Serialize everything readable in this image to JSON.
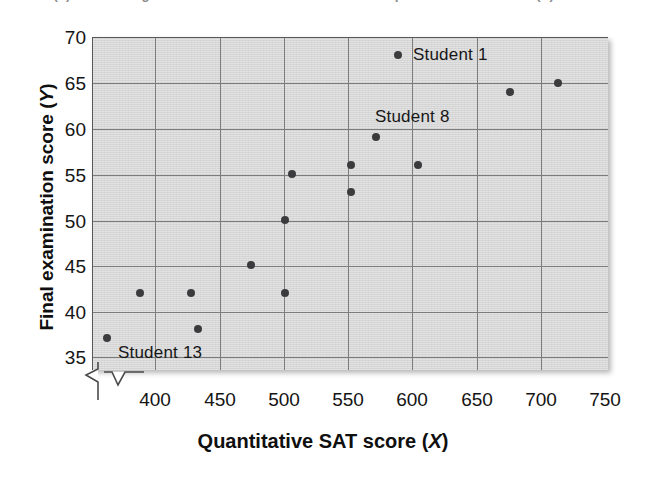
{
  "caption": {
    "text": "FIGURE (b)   Scatter diagram of final examination score versus quantitative SAT score (X)"
  },
  "chart_data": {
    "type": "scatter",
    "title": "",
    "xlabel": "Quantitative SAT score (X)",
    "xlabel_prefix": "Quantitative SAT score (",
    "xlabel_var": "X",
    "xlabel_suffix": ")",
    "ylabel": "Final examination score (Y)",
    "ylabel_prefix": "Final examination score (",
    "ylabel_var": "Y",
    "ylabel_suffix": ")",
    "xlim": [
      370,
      750
    ],
    "ylim": [
      33.5,
      70
    ],
    "xticks": [
      400,
      450,
      500,
      550,
      600,
      650,
      700,
      750
    ],
    "yticks": [
      35,
      40,
      45,
      50,
      55,
      60,
      65,
      70
    ],
    "grid": true,
    "axis_break_x": true,
    "axis_break_y": true,
    "legend": "none",
    "plot_background": "#d6d6d6",
    "point_color": "#3b3b3d",
    "grid_color": "#7c7c7e",
    "points": [
      {
        "x": 381,
        "y": 37,
        "label": ""
      },
      {
        "x": 405,
        "y": 42,
        "label": ""
      },
      {
        "x": 443,
        "y": 42,
        "label": ""
      },
      {
        "x": 448,
        "y": 38,
        "label": ""
      },
      {
        "x": 487,
        "y": 45,
        "label": ""
      },
      {
        "x": 512,
        "y": 42,
        "label": ""
      },
      {
        "x": 512,
        "y": 50,
        "label": ""
      },
      {
        "x": 517,
        "y": 55,
        "label": ""
      },
      {
        "x": 561,
        "y": 53,
        "label": ""
      },
      {
        "x": 561,
        "y": 56,
        "label": ""
      },
      {
        "x": 579,
        "y": 59,
        "label": "Student 8"
      },
      {
        "x": 595,
        "y": 68,
        "label": "Student 1"
      },
      {
        "x": 610,
        "y": 56,
        "label": ""
      },
      {
        "x": 678,
        "y": 64,
        "label": ""
      },
      {
        "x": 713,
        "y": 65,
        "label": ""
      }
    ],
    "annotations": [
      {
        "text": "Student 1",
        "x": 600,
        "y": 68
      },
      {
        "text": "Student 8",
        "x": 560,
        "y": 61
      },
      {
        "text": "Student 13",
        "x": 390,
        "y": 36
      }
    ]
  },
  "annotation_labels": {
    "student1": "Student 1",
    "student8": "Student 8",
    "student13": "Student 13"
  },
  "yticklabels": {
    "t70": "70",
    "t65": "65",
    "t60": "60",
    "t55": "55",
    "t50": "50",
    "t45": "45",
    "t40": "40",
    "t35": "35"
  },
  "xticklabels": {
    "t400": "400",
    "t450": "450",
    "t500": "500",
    "t550": "550",
    "t600": "600",
    "t650": "650",
    "t700": "700",
    "t750": "750"
  }
}
